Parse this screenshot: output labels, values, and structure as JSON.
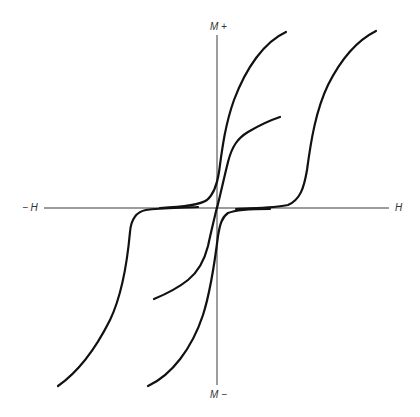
{
  "figure": {
    "labels": {
      "h_positive": "H",
      "h_negative": "− H",
      "m_positive": "M +",
      "m_negative": "M −"
    },
    "colors": {
      "curve": "#111111",
      "axis": "#3a3a3a",
      "text": "#333333",
      "background": "#ffffff"
    },
    "curves": [
      {
        "name": "initial-magnetization-curve",
        "description": "Inner curve from origin rising to partial saturation"
      },
      {
        "name": "upper-branch-left-loop",
        "description": "Steep branch rising near H=0 to positive saturation"
      },
      {
        "name": "upper-branch-right-loop",
        "description": "Wide loop branch switching at positive coercive field"
      },
      {
        "name": "lower-branch-left-loop",
        "description": "Wide loop branch switching at negative coercive field"
      },
      {
        "name": "lower-branch-near-origin",
        "description": "Steep branch falling near H=0 to negative saturation"
      },
      {
        "name": "inner-minor-loop-lower",
        "description": "Minor loop descending branch through origin"
      }
    ]
  }
}
